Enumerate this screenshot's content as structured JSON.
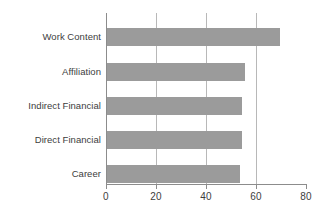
{
  "chart_data": {
    "type": "bar",
    "orientation": "horizontal",
    "title": "",
    "subtitle": "",
    "xlabel": "",
    "ylabel": "",
    "categories": [
      "Work Content",
      "Affiliation",
      "Indirect Financial",
      "Direct Financial",
      "Career"
    ],
    "values": [
      69,
      55,
      54,
      54,
      53
    ],
    "series": [
      {
        "name": "",
        "values": [
          69,
          55,
          54,
          54,
          53
        ]
      }
    ],
    "xlim": [
      0,
      80
    ],
    "xticks": [
      0,
      20,
      40,
      60,
      80
    ],
    "xtick_labels": [
      "0",
      "20",
      "40",
      "60",
      "80"
    ],
    "gridlines_x": [
      20,
      40,
      60
    ],
    "grid": true,
    "legend": false,
    "legend_position": "none",
    "bar_color": "#9b9b9b",
    "gridline_color": "#b8b8b8",
    "axis_color": "#8c8c8c",
    "label_color": "#3d3d3d",
    "background_color": "#ffffff",
    "annotations": []
  },
  "bars": [
    {
      "label": "Work Content",
      "value": 69,
      "top": 28,
      "width_px": 172.5
    },
    {
      "label": "Affiliation",
      "value": 55,
      "top": 63,
      "width_px": 137.5
    },
    {
      "label": "Indirect Financial",
      "value": 54,
      "top": 97,
      "width_px": 135
    },
    {
      "label": "Direct Financial",
      "value": 54,
      "top": 131,
      "width_px": 135
    },
    {
      "label": "Career",
      "value": 53,
      "top": 165,
      "width_px": 132.5
    }
  ],
  "ticks": [
    {
      "label": "0",
      "value": 0,
      "x": 106
    },
    {
      "label": "20",
      "value": 20,
      "x": 156
    },
    {
      "label": "40",
      "value": 40,
      "x": 206
    },
    {
      "label": "60",
      "value": 60,
      "x": 256
    },
    {
      "label": "80",
      "value": 80,
      "x": 306
    }
  ],
  "gridlines": [
    {
      "value": 20,
      "x": 156
    },
    {
      "value": 40,
      "x": 206
    },
    {
      "value": 60,
      "x": 256
    }
  ]
}
